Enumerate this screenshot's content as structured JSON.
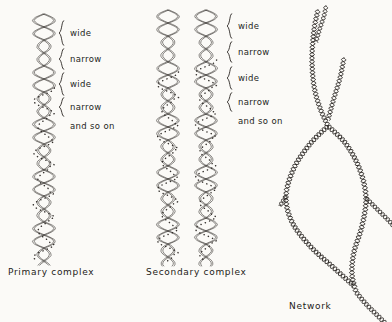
{
  "figure": {
    "background_color": "#fbfaf7",
    "ink_color": "#2b2724"
  },
  "panels": [
    {
      "id": "primary",
      "caption": "Primary  complex",
      "helix_count": 1,
      "labels": [
        {
          "text": "wide",
          "braced": true
        },
        {
          "text": "narrow",
          "braced": true
        },
        {
          "text": "wide",
          "braced": true
        },
        {
          "text": "narrow",
          "braced": true
        },
        {
          "text": "and so on",
          "braced": false
        }
      ]
    },
    {
      "id": "secondary",
      "caption": "Secondary complex",
      "helix_count": 2,
      "labels": [
        {
          "text": "wide",
          "braced": true
        },
        {
          "text": "narrow",
          "braced": true
        },
        {
          "text": "wide",
          "braced": true
        },
        {
          "text": "narrow",
          "braced": true
        },
        {
          "text": "and so on",
          "braced": false
        }
      ]
    },
    {
      "id": "network",
      "caption": "Network",
      "helix_count": 0,
      "labels": []
    }
  ]
}
